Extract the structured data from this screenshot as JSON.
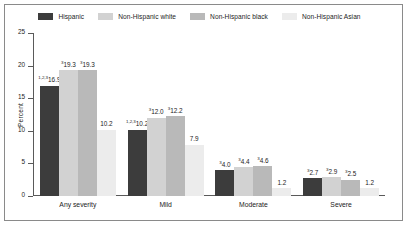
{
  "chart_data": {
    "type": "bar",
    "title": "",
    "xlabel": "",
    "ylabel": "Percent",
    "ylim": [
      0,
      25
    ],
    "yticks": [
      0,
      5,
      10,
      15,
      20,
      25
    ],
    "ytick_labels": [
      "0",
      "5",
      "10",
      "15",
      "20",
      "25"
    ],
    "grid": false,
    "legend_position": "top-center",
    "categories": [
      "Any severity",
      "Mild",
      "Moderate",
      "Severe"
    ],
    "series": [
      {
        "name": "Hispanic",
        "color": "#3c3c3c",
        "values": [
          16.9,
          10.2,
          4.0,
          2.7
        ],
        "value_labels": [
          "16.9",
          "10.2",
          "4.0",
          "2.7"
        ],
        "footnotes": [
          "1,2,3",
          "1,2,3",
          "3",
          "3"
        ]
      },
      {
        "name": "Non-Hispanic white",
        "color": "#d2d2d2",
        "values": [
          19.3,
          12.0,
          4.4,
          2.9
        ],
        "value_labels": [
          "19.3",
          "12.0",
          "4.4",
          "2.9"
        ],
        "footnotes": [
          "3",
          "3",
          "3",
          "3"
        ]
      },
      {
        "name": "Non-Hispanic black",
        "color": "#b9b9b9",
        "values": [
          19.3,
          12.2,
          4.6,
          2.5
        ],
        "value_labels": [
          "19.3",
          "12.2",
          "4.6",
          "2.5"
        ],
        "footnotes": [
          "3",
          "3",
          "3",
          "3"
        ]
      },
      {
        "name": "Non-Hispanic Asian",
        "color": "#ececec",
        "values": [
          10.2,
          7.9,
          1.2,
          1.2
        ],
        "value_labels": [
          "10.2",
          "7.9",
          "1.2",
          "1.2"
        ],
        "footnotes": [
          "",
          "",
          "",
          ""
        ]
      }
    ]
  },
  "legend": {
    "items": [
      {
        "label": "Hispanic",
        "color": "#3c3c3c"
      },
      {
        "label": "Non-Hispanic white",
        "color": "#d2d2d2"
      },
      {
        "label": "Non-Hispanic black",
        "color": "#b9b9b9"
      },
      {
        "label": "Non-Hispanic Asian",
        "color": "#ececec"
      }
    ]
  },
  "axes": {
    "y_label": "Percent",
    "y_tick_labels": [
      "25",
      "20",
      "15",
      "10",
      "5",
      "0"
    ],
    "x_tick_labels": [
      "Any severity",
      "Mild",
      "Moderate",
      "Severe"
    ]
  }
}
